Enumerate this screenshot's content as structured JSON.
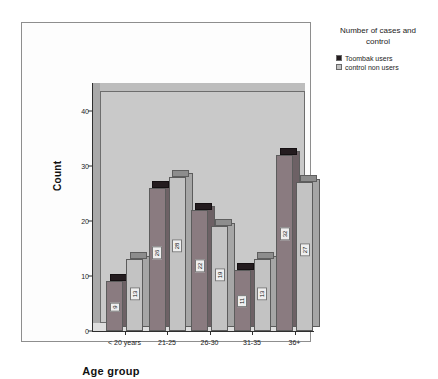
{
  "chart_data": {
    "type": "bar",
    "title": "",
    "xlabel": "Age group",
    "ylabel": "Count",
    "categories": [
      "< 20 years",
      "21-25",
      "26-30",
      "31-35",
      "36+"
    ],
    "series": [
      {
        "name": "Toombak users",
        "color": "#241c1f",
        "values": [
          9,
          26,
          22,
          11,
          32
        ]
      },
      {
        "name": "control non users",
        "color": "#c3c3c3",
        "values": [
          13,
          28,
          19,
          13,
          27
        ]
      }
    ],
    "yticks": [
      0,
      10,
      20,
      30,
      40
    ],
    "ylim": [
      0,
      45
    ],
    "grid": false,
    "legend_position": "right",
    "legend_title": "Number of cases and control"
  },
  "legend": {
    "title_line1": "Number of cases and",
    "title_line2": "control",
    "items": [
      {
        "label": "Toombak users"
      },
      {
        "label": "control non users"
      }
    ]
  },
  "axes": {
    "y_title": "Count",
    "x_title": "Age group",
    "y_ticks": [
      "0",
      "10",
      "20",
      "30",
      "40"
    ],
    "x_ticks": [
      "< 20 years",
      "21-25",
      "26-30",
      "31-35",
      "36+"
    ]
  },
  "labels": {
    "toombak": [
      "9",
      "26",
      "22",
      "11",
      "32"
    ],
    "control": [
      "13",
      "28",
      "19",
      "13",
      "27"
    ]
  }
}
